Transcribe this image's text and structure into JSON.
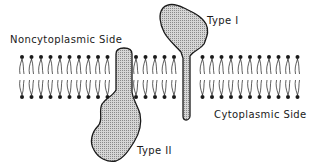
{
  "diagram": {
    "labels": {
      "noncytoplasmic": "Noncytoplasmic Side",
      "cytoplasmic": "Cytoplasmic Side",
      "type1": "Type I",
      "type2": "Type II"
    },
    "membrane": {
      "lipid_start_x": 22,
      "lipid_spacing": 9.5,
      "lipid_count": 30,
      "top_head_y": 57,
      "bottom_head_y": 97,
      "head_radius": 2,
      "gap_ranges": [
        [
          110,
          134
        ],
        [
          176,
          194
        ]
      ]
    },
    "colors": {
      "ink": "#1a1a1a",
      "protein_fill": "#c8c8c8",
      "background": "#ffffff"
    },
    "proteins": [
      {
        "name": "Type I",
        "orientation": "N-terminus noncytoplasmic, single-pass"
      },
      {
        "name": "Type II",
        "orientation": "N-terminus cytoplasmic, single-pass"
      }
    ]
  }
}
